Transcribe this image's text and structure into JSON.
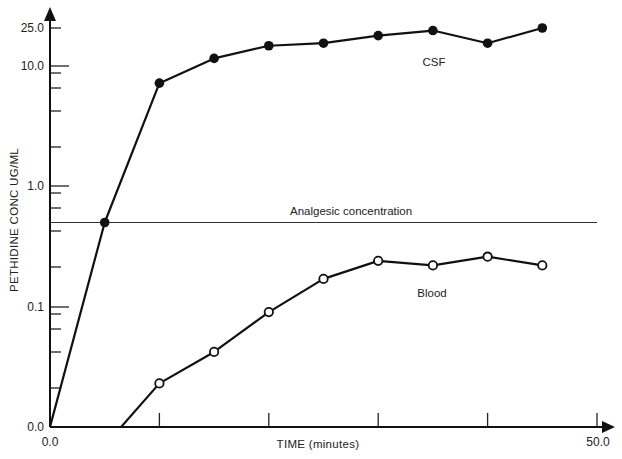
{
  "chart_data": {
    "type": "line",
    "title": "",
    "xlabel": "TIME (minutes)",
    "ylabel": "PETHIDINE CONC UG/ML",
    "xlim": [
      0,
      50
    ],
    "x_tick_labels": [
      {
        "value": 0,
        "label": "0.0"
      },
      {
        "value": 50,
        "label": "50.0"
      }
    ],
    "x_ticks": [
      10,
      20,
      30,
      40,
      50
    ],
    "y_scale": "log",
    "y_tick_labels": [
      {
        "value": 25,
        "label": "25.0"
      },
      {
        "value": 10,
        "label": "10.0"
      },
      {
        "value": 1,
        "label": "1.0"
      },
      {
        "value": 0.1,
        "label": "0.1"
      },
      {
        "value": 0.01,
        "label": "0.0"
      }
    ],
    "grid": false,
    "series": [
      {
        "name": "CSF",
        "marker": "filled-circle",
        "x": [
          0,
          5,
          10,
          15,
          20,
          25,
          30,
          35,
          40,
          45
        ],
        "values": [
          0.01,
          0.5,
          7.2,
          13,
          18,
          19,
          22,
          24,
          19,
          25
        ],
        "marked": [
          false,
          true,
          true,
          true,
          true,
          true,
          true,
          true,
          true,
          true
        ]
      },
      {
        "name": "Blood",
        "marker": "open-circle",
        "x": [
          6.5,
          10,
          15,
          20,
          25,
          30,
          35,
          40,
          45
        ],
        "values": [
          0.01,
          0.023,
          0.042,
          0.09,
          0.17,
          0.24,
          0.22,
          0.26,
          0.22
        ],
        "marked": [
          false,
          true,
          true,
          true,
          true,
          true,
          true,
          true,
          true
        ]
      }
    ],
    "reference_lines": [
      {
        "name": "Analgesic concentration",
        "y": 0.5
      }
    ],
    "annotations": [
      {
        "text": "CSF",
        "x": 35,
        "y": 12
      },
      {
        "text": "Blood",
        "x": 35,
        "y": 0.12
      },
      {
        "text": "Analgesic concentration",
        "x": 30,
        "y": 0.65
      }
    ]
  },
  "labels": {
    "x_axis_title": "TIME (minutes)",
    "y_axis_title": "PETHIDINE CONC UG/ML",
    "x_origin": "0.0",
    "x_end": "50.0",
    "y_25": "25.0",
    "y_10": "10.0",
    "y_1": "1.0",
    "y_01": "0.1",
    "y_0": "0.0",
    "csf": "CSF",
    "blood": "Blood",
    "analgesic": "Analgesic concentration"
  }
}
